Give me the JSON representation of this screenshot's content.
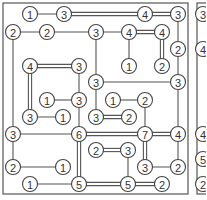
{
  "puzzle": {
    "type": "hashiwokakero",
    "main_panel": {
      "nodes": [
        {
          "id": "n1",
          "x": 30,
          "y": 14,
          "value": "1"
        },
        {
          "id": "n2",
          "x": 64,
          "y": 14,
          "value": "3"
        },
        {
          "id": "n3",
          "x": 145,
          "y": 14,
          "value": "4"
        },
        {
          "id": "n4",
          "x": 178,
          "y": 14,
          "value": "3"
        },
        {
          "id": "n5",
          "x": 13,
          "y": 32,
          "value": "2"
        },
        {
          "id": "n6",
          "x": 47,
          "y": 32,
          "value": "2"
        },
        {
          "id": "n7",
          "x": 96,
          "y": 32,
          "value": "3"
        },
        {
          "id": "n8",
          "x": 129,
          "y": 32,
          "value": "4"
        },
        {
          "id": "n9",
          "x": 162,
          "y": 32,
          "value": "4"
        },
        {
          "id": "n10",
          "x": 178,
          "y": 49,
          "value": "2"
        },
        {
          "id": "n11",
          "x": 30,
          "y": 66,
          "value": "4"
        },
        {
          "id": "n12",
          "x": 79,
          "y": 66,
          "value": "3"
        },
        {
          "id": "n13",
          "x": 129,
          "y": 66,
          "value": "1"
        },
        {
          "id": "n14",
          "x": 162,
          "y": 66,
          "value": "2"
        },
        {
          "id": "n15",
          "x": 96,
          "y": 82,
          "value": "3"
        },
        {
          "id": "n16",
          "x": 178,
          "y": 82,
          "value": "3"
        },
        {
          "id": "n17",
          "x": 47,
          "y": 100,
          "value": "1"
        },
        {
          "id": "n18",
          "x": 79,
          "y": 100,
          "value": "3"
        },
        {
          "id": "n19",
          "x": 113,
          "y": 100,
          "value": "1"
        },
        {
          "id": "n20",
          "x": 145,
          "y": 100,
          "value": "2"
        },
        {
          "id": "n21",
          "x": 30,
          "y": 117,
          "value": "3"
        },
        {
          "id": "n22",
          "x": 63,
          "y": 117,
          "value": "1"
        },
        {
          "id": "n23",
          "x": 96,
          "y": 117,
          "value": "3"
        },
        {
          "id": "n24",
          "x": 129,
          "y": 117,
          "value": "2"
        },
        {
          "id": "n25",
          "x": 13,
          "y": 134,
          "value": "3"
        },
        {
          "id": "n26",
          "x": 79,
          "y": 134,
          "value": "6"
        },
        {
          "id": "n27",
          "x": 145,
          "y": 134,
          "value": "7"
        },
        {
          "id": "n28",
          "x": 178,
          "y": 134,
          "value": "4"
        },
        {
          "id": "n29",
          "x": 96,
          "y": 150,
          "value": "2"
        },
        {
          "id": "n30",
          "x": 128,
          "y": 150,
          "value": "3"
        },
        {
          "id": "n31",
          "x": 13,
          "y": 167,
          "value": "2"
        },
        {
          "id": "n32",
          "x": 63,
          "y": 167,
          "value": "1"
        },
        {
          "id": "n33",
          "x": 145,
          "y": 167,
          "value": "3"
        },
        {
          "id": "n34",
          "x": 178,
          "y": 167,
          "value": "2"
        },
        {
          "id": "n35",
          "x": 30,
          "y": 184,
          "value": "1"
        },
        {
          "id": "n36",
          "x": 79,
          "y": 184,
          "value": "5"
        },
        {
          "id": "n37",
          "x": 128,
          "y": 184,
          "value": "5"
        },
        {
          "id": "n38",
          "x": 162,
          "y": 184,
          "value": "2"
        }
      ],
      "bridges": [
        {
          "from": "n1",
          "to": "n2",
          "count": 1
        },
        {
          "from": "n2",
          "to": "n3",
          "count": 2
        },
        {
          "from": "n3",
          "to": "n4",
          "count": 2
        },
        {
          "from": "n4",
          "to": "n10",
          "count": 1
        },
        {
          "from": "n5",
          "to": "n6",
          "count": 1
        },
        {
          "from": "n6",
          "to": "n7",
          "count": 1
        },
        {
          "from": "n7",
          "to": "n8",
          "count": 1
        },
        {
          "from": "n8",
          "to": "n9",
          "count": 2
        },
        {
          "from": "n8",
          "to": "n13",
          "count": 1
        },
        {
          "from": "n9",
          "to": "n14",
          "count": 2
        },
        {
          "from": "n10",
          "to": "n16",
          "count": 1
        },
        {
          "from": "n5",
          "to": "n25",
          "count": 1
        },
        {
          "from": "n7",
          "to": "n15",
          "count": 1
        },
        {
          "from": "n11",
          "to": "n12",
          "count": 2
        },
        {
          "from": "n11",
          "to": "n21",
          "count": 2
        },
        {
          "from": "n12",
          "to": "n18",
          "count": 1
        },
        {
          "from": "n15",
          "to": "n16",
          "count": 1
        },
        {
          "from": "n15",
          "to": "n23",
          "count": 1
        },
        {
          "from": "n16",
          "to": "n28",
          "count": 1
        },
        {
          "from": "n17",
          "to": "n18",
          "count": 1
        },
        {
          "from": "n18",
          "to": "n26",
          "count": 1
        },
        {
          "from": "n19",
          "to": "n20",
          "count": 1
        },
        {
          "from": "n20",
          "to": "n27",
          "count": 1
        },
        {
          "from": "n21",
          "to": "n22",
          "count": 1
        },
        {
          "from": "n23",
          "to": "n24",
          "count": 2
        },
        {
          "from": "n25",
          "to": "n26",
          "count": 1
        },
        {
          "from": "n26",
          "to": "n27",
          "count": 2
        },
        {
          "from": "n27",
          "to": "n28",
          "count": 2
        },
        {
          "from": "n26",
          "to": "n36",
          "count": 2
        },
        {
          "from": "n27",
          "to": "n33",
          "count": 2
        },
        {
          "from": "n28",
          "to": "n34",
          "count": 1
        },
        {
          "from": "n29",
          "to": "n30",
          "count": 2
        },
        {
          "from": "n30",
          "to": "n37",
          "count": 1
        },
        {
          "from": "n25",
          "to": "n31",
          "count": 1
        },
        {
          "from": "n31",
          "to": "n32",
          "count": 1
        },
        {
          "from": "n33",
          "to": "n34",
          "count": 1
        },
        {
          "from": "n35",
          "to": "n36",
          "count": 1
        },
        {
          "from": "n36",
          "to": "n37",
          "count": 2
        },
        {
          "from": "n37",
          "to": "n38",
          "count": 2
        }
      ]
    },
    "side_panel_partial": {
      "visible_values": [
        "3",
        "4",
        "4",
        "5",
        "2"
      ],
      "nodes": [
        {
          "x": 203,
          "y": 14,
          "value": "3"
        },
        {
          "x": 203,
          "y": 49,
          "value": "4"
        },
        {
          "x": 203,
          "y": 134,
          "value": "4"
        },
        {
          "x": 203,
          "y": 159,
          "value": "5"
        },
        {
          "x": 203,
          "y": 184,
          "value": "2"
        }
      ]
    }
  }
}
